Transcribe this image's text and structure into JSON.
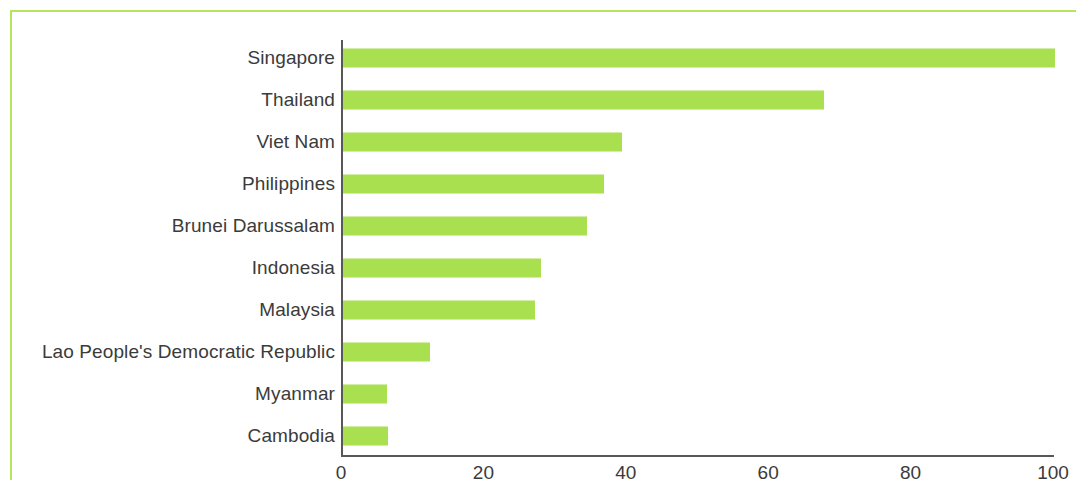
{
  "frame": {
    "border_color": "#b5e55c"
  },
  "axis": {
    "line_color": "#585858",
    "bar_color": "#a8e050",
    "text_color": "#3b3b3b"
  },
  "chart_data": {
    "type": "bar",
    "orientation": "horizontal",
    "title": "",
    "subtitle": "",
    "xlabel": "",
    "ylabel": "",
    "xlim": [
      0,
      100
    ],
    "xticks": [
      0,
      20,
      40,
      60,
      80,
      100
    ],
    "xtick_labels": [
      "0",
      "20",
      "40",
      "60",
      "80",
      "100"
    ],
    "grid": false,
    "legend": false,
    "categories": [
      "Singapore",
      "Thailand",
      "Viet Nam",
      "Philippines",
      "Brunei Darussalam",
      "Indonesia",
      "Malaysia",
      "Lao People's Democratic Republic",
      "Myanmar",
      "Cambodia"
    ],
    "values": [
      100,
      67.6,
      39.2,
      36.7,
      34.3,
      27.8,
      27.0,
      12.2,
      6.2,
      6.3
    ],
    "series": [
      {
        "name": "",
        "color": "#a8e050",
        "values": [
          100,
          67.6,
          39.2,
          36.7,
          34.3,
          27.8,
          27.0,
          12.2,
          6.2,
          6.3
        ]
      }
    ]
  }
}
